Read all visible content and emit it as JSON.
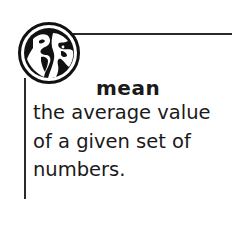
{
  "glossary": {
    "icon": "globe-icon",
    "term": "mean",
    "definition_lines": [
      "the average value",
      "of a given set of",
      "numbers."
    ]
  },
  "colors": {
    "line": "#2a2a2a",
    "text": "#1a1a1a",
    "background": "#ffffff"
  }
}
